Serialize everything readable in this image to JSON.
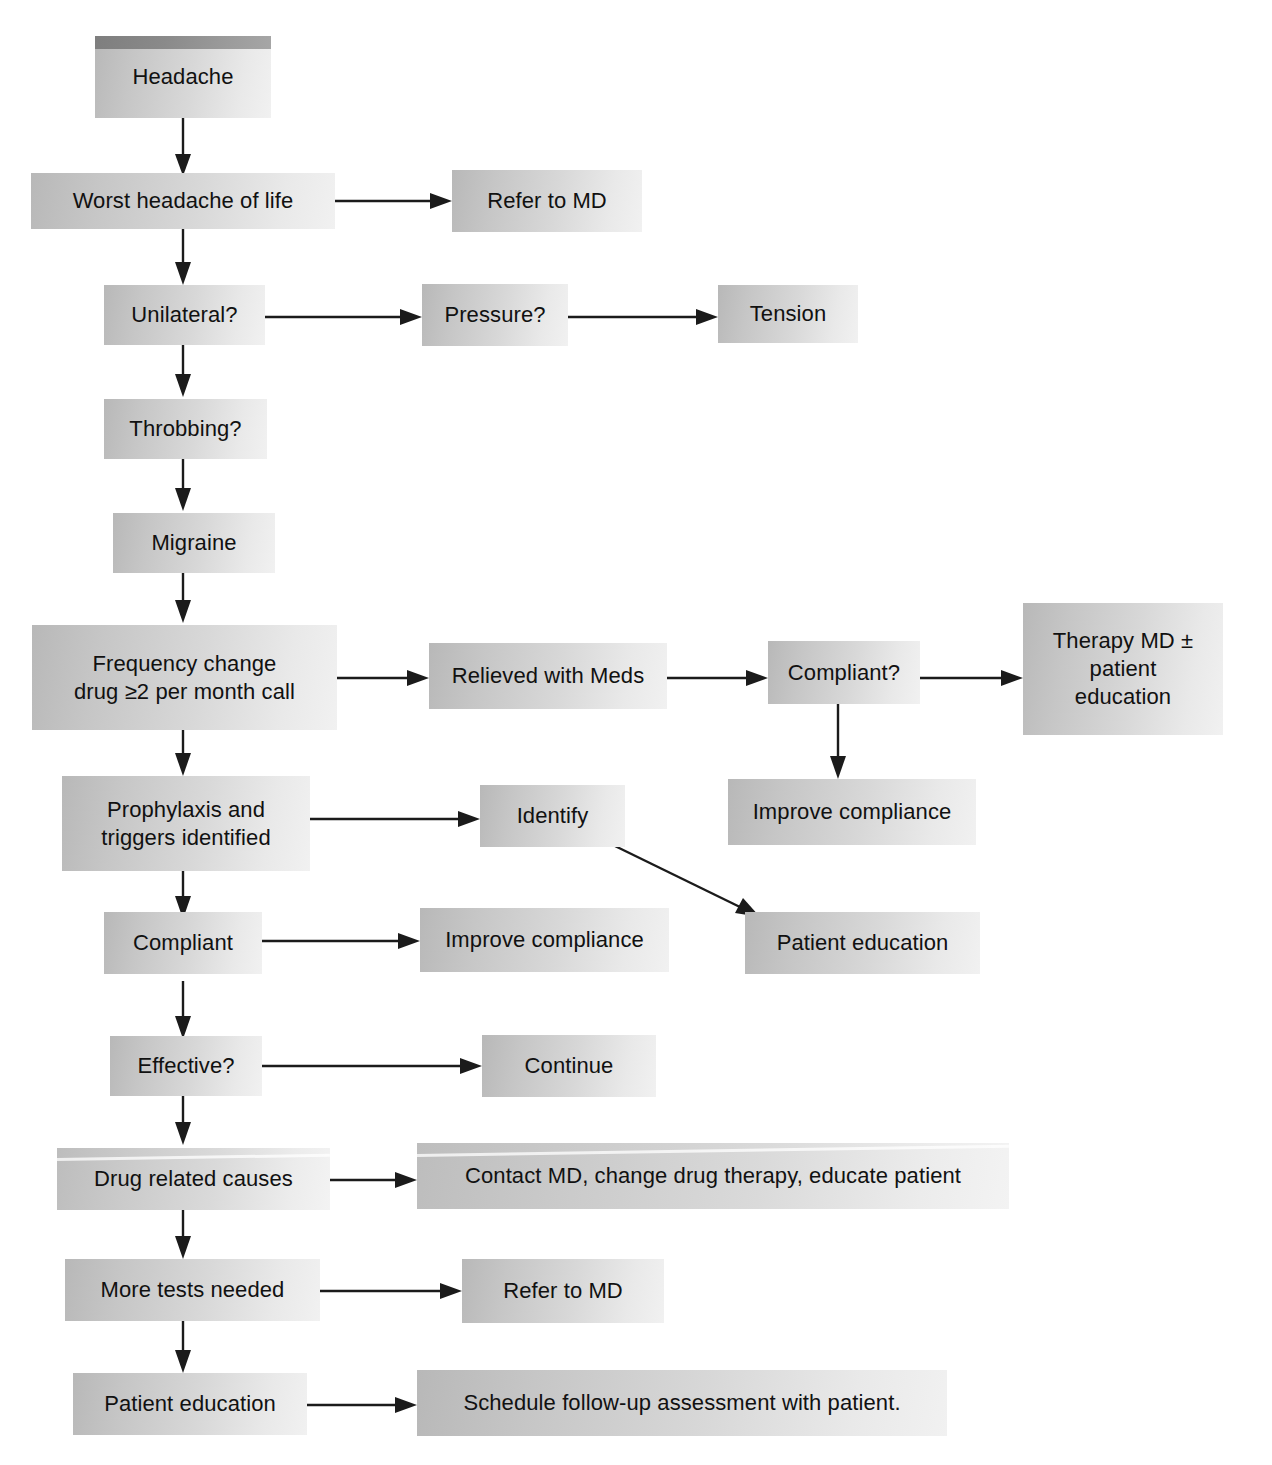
{
  "diagram": {
    "background_color": "#ffffff",
    "box_fill_light": "#f1f1f1",
    "box_fill_dark": "#b8b8b8",
    "accent_header_color": "#8a8a8a",
    "arrow_color": "#1b1b1b"
  },
  "nodes": [
    {
      "id": "headache",
      "label": "Headache"
    },
    {
      "id": "worst_headache",
      "label": "Worst headache of life"
    },
    {
      "id": "refer_md_top",
      "label": "Refer to MD"
    },
    {
      "id": "unilateral",
      "label": "Unilateral?"
    },
    {
      "id": "pressure",
      "label": "Pressure?"
    },
    {
      "id": "tension",
      "label": "Tension"
    },
    {
      "id": "throbbing",
      "label": "Throbbing?"
    },
    {
      "id": "migraine",
      "label": "Migraine"
    },
    {
      "id": "frequency_change",
      "label": "Frequency change\ndrug ≥2 per month call"
    },
    {
      "id": "relieved_meds",
      "label": "Relieved with Meds"
    },
    {
      "id": "compliant_q",
      "label": "Compliant?"
    },
    {
      "id": "therapy_md",
      "label": "Therapy MD ±\npatient\neducation"
    },
    {
      "id": "improve_comp_right",
      "label": "Improve compliance"
    },
    {
      "id": "prophylaxis",
      "label": "Prophylaxis and\ntriggers identified"
    },
    {
      "id": "identify",
      "label": "Identify"
    },
    {
      "id": "compliant",
      "label": "Compliant"
    },
    {
      "id": "improve_comp_mid",
      "label": "Improve compliance"
    },
    {
      "id": "patient_edu_mid",
      "label": "Patient education"
    },
    {
      "id": "effective",
      "label": "Effective?"
    },
    {
      "id": "continue",
      "label": "Continue"
    },
    {
      "id": "drug_causes",
      "label": "Drug related causes"
    },
    {
      "id": "contact_md",
      "label": "Contact MD, change drug therapy, educate patient"
    },
    {
      "id": "more_tests",
      "label": "More tests needed"
    },
    {
      "id": "refer_md_bottom",
      "label": "Refer to MD"
    },
    {
      "id": "patient_edu_bottom",
      "label": "Patient education"
    },
    {
      "id": "schedule_followup",
      "label": "Schedule follow-up assessment with patient."
    }
  ],
  "edges": [
    {
      "from": "headache",
      "to": "worst_headache",
      "direction": "down"
    },
    {
      "from": "worst_headache",
      "to": "refer_md_top",
      "direction": "right"
    },
    {
      "from": "worst_headache",
      "to": "unilateral",
      "direction": "down"
    },
    {
      "from": "unilateral",
      "to": "pressure",
      "direction": "right"
    },
    {
      "from": "pressure",
      "to": "tension",
      "direction": "right"
    },
    {
      "from": "unilateral",
      "to": "throbbing",
      "direction": "down"
    },
    {
      "from": "throbbing",
      "to": "migraine",
      "direction": "down"
    },
    {
      "from": "migraine",
      "to": "frequency_change",
      "direction": "down"
    },
    {
      "from": "frequency_change",
      "to": "relieved_meds",
      "direction": "right"
    },
    {
      "from": "relieved_meds",
      "to": "compliant_q",
      "direction": "right"
    },
    {
      "from": "compliant_q",
      "to": "therapy_md",
      "direction": "right"
    },
    {
      "from": "compliant_q",
      "to": "improve_comp_right",
      "direction": "down"
    },
    {
      "from": "frequency_change",
      "to": "prophylaxis",
      "direction": "down"
    },
    {
      "from": "prophylaxis",
      "to": "identify",
      "direction": "right"
    },
    {
      "from": "identify",
      "to": "patient_edu_mid",
      "direction": "diagonal"
    },
    {
      "from": "prophylaxis",
      "to": "compliant",
      "direction": "down"
    },
    {
      "from": "compliant",
      "to": "improve_comp_mid",
      "direction": "right"
    },
    {
      "from": "compliant",
      "to": "effective",
      "direction": "down"
    },
    {
      "from": "effective",
      "to": "continue",
      "direction": "right"
    },
    {
      "from": "effective",
      "to": "drug_causes",
      "direction": "down"
    },
    {
      "from": "drug_causes",
      "to": "contact_md",
      "direction": "right"
    },
    {
      "from": "drug_causes",
      "to": "more_tests",
      "direction": "down"
    },
    {
      "from": "more_tests",
      "to": "refer_md_bottom",
      "direction": "right"
    },
    {
      "from": "more_tests",
      "to": "patient_edu_bottom",
      "direction": "down"
    },
    {
      "from": "patient_edu_bottom",
      "to": "schedule_followup",
      "direction": "right"
    }
  ]
}
